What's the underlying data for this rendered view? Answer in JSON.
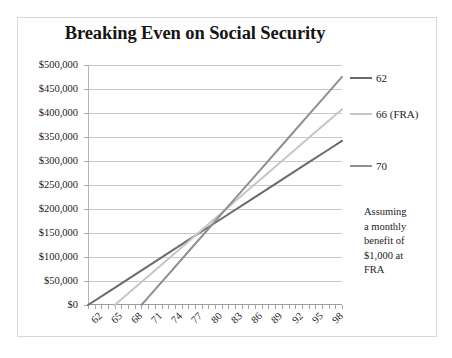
{
  "figure": {
    "title": "Breaking Even on Social Security",
    "background_color": "#ffffff",
    "frame_color": "#d8d8d8"
  },
  "legend": {
    "position": "right",
    "items": [
      {
        "label": "62",
        "color": "#6b6b6b"
      },
      {
        "label": "66 (FRA)",
        "color": "#c6c6c6"
      },
      {
        "label": "70",
        "color": "#8f8f8f"
      }
    ]
  },
  "annotation": {
    "lines": [
      "Assuming",
      "a monthly",
      "benefit of",
      "$1,000 at",
      "FRA"
    ]
  },
  "axes": {
    "y_tick_labels": [
      "$500,000",
      "$450,000",
      "$400,000",
      "$350,000",
      "$300,000",
      "$250,000",
      "$200,000",
      "$150,000",
      "$100,000",
      "$50,000",
      "$0"
    ],
    "x_tick_labels": [
      "62",
      "65",
      "68",
      "71",
      "74",
      "77",
      "80",
      "83",
      "86",
      "89",
      "92",
      "95",
      "98"
    ]
  },
  "chart_data": {
    "type": "line",
    "title": "Breaking Even on Social Security",
    "subtitle": "",
    "xlabel": "",
    "ylabel": "",
    "xlim": [
      62,
      100
    ],
    "ylim": [
      0,
      500000
    ],
    "ytick_interval": 50000,
    "xtick_label_interval": 3,
    "grid": true,
    "grid_axis": "y",
    "legend_position": "right",
    "annotation_text": "Assuming a monthly benefit of $1,000 at FRA",
    "x_label_rotation_deg": -45,
    "series": [
      {
        "name": "62",
        "color": "#6b6b6b",
        "claim_age": 62,
        "monthly_benefit": 750,
        "annual_benefit": 9000,
        "points": [
          {
            "x": 62,
            "y": 0
          },
          {
            "x": 65,
            "y": 27000
          },
          {
            "x": 68,
            "y": 54000
          },
          {
            "x": 71,
            "y": 81000
          },
          {
            "x": 74,
            "y": 108000
          },
          {
            "x": 77,
            "y": 135000
          },
          {
            "x": 80,
            "y": 162000
          },
          {
            "x": 83,
            "y": 189000
          },
          {
            "x": 86,
            "y": 216000
          },
          {
            "x": 89,
            "y": 243000
          },
          {
            "x": 92,
            "y": 270000
          },
          {
            "x": 95,
            "y": 297000
          },
          {
            "x": 98,
            "y": 324000
          },
          {
            "x": 100,
            "y": 342000
          }
        ]
      },
      {
        "name": "66 (FRA)",
        "color": "#c6c6c6",
        "claim_age": 66,
        "monthly_benefit": 1000,
        "annual_benefit": 12000,
        "points": [
          {
            "x": 66,
            "y": 0
          },
          {
            "x": 68,
            "y": 24000
          },
          {
            "x": 71,
            "y": 60000
          },
          {
            "x": 74,
            "y": 96000
          },
          {
            "x": 77,
            "y": 132000
          },
          {
            "x": 80,
            "y": 168000
          },
          {
            "x": 83,
            "y": 204000
          },
          {
            "x": 86,
            "y": 240000
          },
          {
            "x": 89,
            "y": 276000
          },
          {
            "x": 92,
            "y": 312000
          },
          {
            "x": 95,
            "y": 348000
          },
          {
            "x": 98,
            "y": 384000
          },
          {
            "x": 100,
            "y": 408000
          }
        ]
      },
      {
        "name": "70",
        "color": "#8f8f8f",
        "claim_age": 70,
        "monthly_benefit": 1320,
        "annual_benefit": 15840,
        "points": [
          {
            "x": 70,
            "y": 0
          },
          {
            "x": 71,
            "y": 15840
          },
          {
            "x": 74,
            "y": 63360
          },
          {
            "x": 77,
            "y": 110880
          },
          {
            "x": 80,
            "y": 158400
          },
          {
            "x": 83,
            "y": 205920
          },
          {
            "x": 86,
            "y": 253440
          },
          {
            "x": 89,
            "y": 300960
          },
          {
            "x": 92,
            "y": 348480
          },
          {
            "x": 95,
            "y": 396000
          },
          {
            "x": 98,
            "y": 443520
          },
          {
            "x": 100,
            "y": 475200
          }
        ]
      }
    ]
  }
}
